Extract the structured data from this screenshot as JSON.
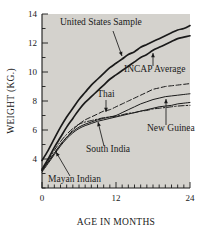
{
  "chart_data": {
    "type": "line",
    "title": "",
    "xlabel": "AGE IN MONTHS",
    "ylabel": "WEIGHT (KG.)",
    "xlim": [
      0,
      24
    ],
    "ylim": [
      2,
      14
    ],
    "xticks": [
      0,
      12,
      24
    ],
    "xtick_labels": [
      "0",
      "12",
      "24"
    ],
    "x_minor_tick_interval": 1,
    "yticks": [
      4,
      6,
      8,
      10,
      12,
      14
    ],
    "ytick_labels": [
      "4",
      "6",
      "8",
      "10",
      "12",
      "14"
    ],
    "y_minor_tick_interval": 1,
    "grid": false,
    "legend_position": "inline-annotations",
    "plot_background": "#d4d2cd",
    "line_color": "#1a1a1a",
    "x": [
      0,
      1,
      2,
      3,
      4,
      5,
      6,
      7,
      8,
      9,
      10,
      11,
      12,
      13,
      14,
      15,
      16,
      17,
      18,
      19,
      20,
      21,
      22,
      23,
      24
    ],
    "series": [
      {
        "name": "United States Sample",
        "style": "solid",
        "values": [
          3.9,
          4.6,
          5.4,
          6.2,
          6.9,
          7.5,
          8.1,
          8.6,
          9.1,
          9.5,
          9.9,
          10.3,
          10.6,
          10.9,
          11.2,
          11.4,
          11.7,
          11.9,
          12.1,
          12.3,
          12.5,
          12.7,
          12.9,
          13.0,
          13.2
        ]
      },
      {
        "name": "INCAP Average",
        "style": "solid",
        "values": [
          3.3,
          4.0,
          4.8,
          5.5,
          6.2,
          6.8,
          7.4,
          7.9,
          8.3,
          8.7,
          9.1,
          9.5,
          9.8,
          10.1,
          10.4,
          10.7,
          11.0,
          11.2,
          11.5,
          11.7,
          11.9,
          12.1,
          12.3,
          12.4,
          12.5
        ]
      },
      {
        "name": "Thai",
        "style": "dashed",
        "values": [
          3.2,
          3.8,
          4.4,
          5.0,
          5.5,
          6.0,
          6.4,
          6.7,
          6.9,
          7.1,
          7.3,
          7.4,
          7.6,
          7.8,
          8.0,
          8.2,
          8.4,
          8.6,
          8.8,
          8.9,
          9.0,
          9.05,
          9.1,
          9.15,
          9.2
        ]
      },
      {
        "name": "New Guinea",
        "style": "solid",
        "values": [
          3.2,
          3.8,
          4.4,
          5.0,
          5.5,
          5.9,
          6.2,
          6.4,
          6.55,
          6.7,
          6.8,
          6.9,
          7.0,
          7.2,
          7.4,
          7.6,
          7.8,
          7.95,
          8.1,
          8.2,
          8.3,
          8.35,
          8.4,
          8.45,
          8.5
        ]
      },
      {
        "name": "South India",
        "style": "solid",
        "values": [
          3.1,
          3.7,
          4.3,
          4.9,
          5.4,
          5.8,
          6.1,
          6.3,
          6.45,
          6.6,
          6.7,
          6.8,
          6.9,
          7.0,
          7.1,
          7.2,
          7.3,
          7.4,
          7.5,
          7.6,
          7.65,
          7.7,
          7.8,
          7.85,
          7.9
        ]
      },
      {
        "name": "Mayan Indian",
        "style": "dashdot",
        "values": [
          3.2,
          3.9,
          4.6,
          5.2,
          5.7,
          6.1,
          6.4,
          6.55,
          6.65,
          6.75,
          6.85,
          6.9,
          6.95,
          7.05,
          7.15,
          7.2,
          7.3,
          7.35,
          7.45,
          7.5,
          7.55,
          7.6,
          7.65,
          7.68,
          7.7
        ]
      }
    ],
    "annotations": [
      {
        "label": "United States Sample",
        "text_x": 60,
        "text_y": 25,
        "anchor": "start",
        "arrow_from_x": 113,
        "arrow_from_y": 31,
        "arrow_to_x": 122,
        "arrow_to_y": 56
      },
      {
        "label": "INCAP Average",
        "text_x": 124,
        "text_y": 72,
        "anchor": "start",
        "arrow_from_x": 153,
        "arrow_from_y": 66,
        "arrow_to_x": 153,
        "arrow_to_y": 53
      },
      {
        "label": "Thai",
        "text_x": 106,
        "text_y": 97,
        "anchor": "middle",
        "arrow_from_x": 106,
        "arrow_from_y": 100,
        "arrow_to_x": 106,
        "arrow_to_y": 112
      },
      {
        "label": "New Guinea",
        "text_x": 147,
        "text_y": 131,
        "anchor": "start",
        "arrow_from_x": 166,
        "arrow_from_y": 125,
        "arrow_to_x": 166,
        "arrow_to_y": 99
      },
      {
        "label": "South India",
        "text_x": 86,
        "text_y": 152,
        "anchor": "start",
        "arrow_from_x": 104,
        "arrow_from_y": 146,
        "arrow_to_x": 98,
        "arrow_to_y": 122
      },
      {
        "label": "Mayan Indian",
        "text_x": 48,
        "text_y": 182,
        "anchor": "start",
        "arrow_from_x": 70,
        "arrow_from_y": 176,
        "arrow_to_x": 56,
        "arrow_to_y": 152
      }
    ]
  }
}
